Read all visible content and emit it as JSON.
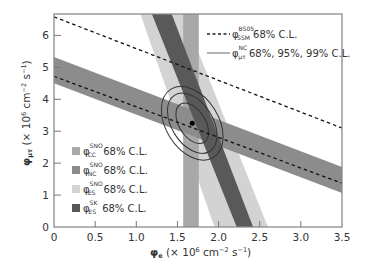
{
  "chart_data": {
    "type": "area",
    "title": "",
    "xlabel": "φe (× 10^6 cm^-2 s^-1)",
    "ylabel": "φμτ (× 10^6 cm^-2 s^-1)",
    "xlabel_parts": {
      "sym": "φ",
      "sub": "e",
      "rest": " (× 10",
      "exp": "6",
      "unit": " cm",
      "unit_exp": "−2",
      "unit2": " s",
      "unit2_exp": "−1",
      "close": ")"
    },
    "ylabel_parts": {
      "sym": "φ",
      "sub": "μτ",
      "rest": " (× 10",
      "exp": "6",
      "unit": " cm",
      "unit_exp": "−2",
      "unit2": " s",
      "unit2_exp": "−1",
      "close": ")"
    },
    "xlim": [
      0,
      3.5
    ],
    "ylim": [
      0,
      6.67
    ],
    "xticks": [
      0,
      0.5,
      1.0,
      1.5,
      2.0,
      2.5,
      3.0,
      3.5
    ],
    "xtick_labels": [
      "0",
      "0.5",
      "1.0",
      "1.5",
      "2.0",
      "2.5",
      "3.0",
      "3.5"
    ],
    "yticks": [
      0,
      1,
      2,
      3,
      4,
      5,
      6
    ],
    "ytick_labels": [
      "0",
      "1",
      "2",
      "3",
      "4",
      "5",
      "6"
    ],
    "grid": false,
    "bands": [
      {
        "name": "phi_ES_SNO",
        "color": "#d3d3d3",
        "polygon": [
          [
            1.05,
            6.67
          ],
          [
            1.57,
            6.67
          ],
          [
            2.6,
            0
          ],
          [
            1.95,
            0
          ]
        ]
      },
      {
        "name": "phi_CC_SNO",
        "color": "#a8a8a8",
        "polygon": [
          [
            1.57,
            6.67
          ],
          [
            1.76,
            6.67
          ],
          [
            1.76,
            0
          ],
          [
            1.57,
            0
          ]
        ]
      },
      {
        "name": "phi_NC_SNO",
        "color": "#8c8c8c",
        "polygon": [
          [
            0,
            5.32
          ],
          [
            3.5,
            1.88
          ],
          [
            3.5,
            1.06
          ],
          [
            0,
            4.5
          ]
        ]
      },
      {
        "name": "phi_ES_SK",
        "color": "#595959",
        "polygon": [
          [
            1.19,
            6.67
          ],
          [
            1.43,
            6.67
          ],
          [
            2.42,
            0
          ],
          [
            2.22,
            0
          ]
        ]
      }
    ],
    "lines": [
      {
        "name": "phi_SSM_BS05_upper",
        "style": "dashed",
        "points": [
          [
            0,
            6.58
          ],
          [
            3.5,
            3.1
          ]
        ]
      },
      {
        "name": "phi_SSM_BS05_lower",
        "style": "dashed",
        "points": [
          [
            0,
            4.72
          ],
          [
            3.5,
            1.37
          ]
        ]
      }
    ],
    "contours": {
      "center": [
        1.68,
        3.25
      ],
      "angle_deg": -32,
      "levels": [
        {
          "cl": "68%",
          "rx": 0.16,
          "ry": 0.78
        },
        {
          "cl": "95%",
          "rx": 0.25,
          "ry": 1.15
        },
        {
          "cl": "99%",
          "rx": 0.32,
          "ry": 1.4
        }
      ]
    },
    "best_fit": [
      1.68,
      3.25
    ],
    "legend_top_right": [
      {
        "style": "dashed",
        "sym": "φ",
        "sup": "BS05",
        "sub": "SSM",
        "text": " 68% C.L."
      },
      {
        "style": "solid",
        "sym": "φ",
        "sup": "NC",
        "sub": "μτ",
        "text": " 68%, 95%, 99% C.L."
      }
    ],
    "legend_bottom_left": [
      {
        "color": "#a8a8a8",
        "sym": "φ",
        "sup": "SNO",
        "sub": "CC",
        "text": " 68% C.L."
      },
      {
        "color": "#8c8c8c",
        "sym": "φ",
        "sup": "SNO",
        "sub": "NC",
        "text": " 68% C.L."
      },
      {
        "color": "#d3d3d3",
        "sym": "φ",
        "sup": "SNO",
        "sub": "ES",
        "text": " 68% C.L."
      },
      {
        "color": "#595959",
        "sym": "φ",
        "sup": "SK",
        "sub": "ES",
        "text": " 68% C.L."
      }
    ],
    "legend_position": "upper right and lower left"
  }
}
